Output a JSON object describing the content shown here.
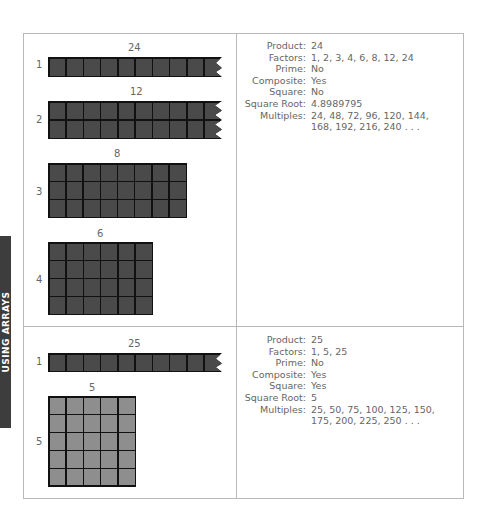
{
  "side_tab": {
    "label": "USING ARRAYS"
  },
  "sections": [
    {
      "arrays": [
        {
          "rows": 1,
          "cols_label": "24",
          "row_label": "1",
          "shade": "dark",
          "torn": true
        },
        {
          "rows": 2,
          "cols_label": "12",
          "row_label": "2",
          "shade": "dark",
          "torn": true
        },
        {
          "rows": 3,
          "cols_label": "8",
          "row_label": "3",
          "shade": "dark",
          "torn": false
        },
        {
          "rows": 4,
          "cols_label": "6",
          "row_label": "4",
          "shade": "dark",
          "torn": false
        }
      ],
      "info": {
        "product_label": "Product:",
        "product": "24",
        "factors_label": "Factors:",
        "factors": "1, 2, 3, 4, 6, 8, 12, 24",
        "prime_label": "Prime:",
        "prime": "No",
        "composite_label": "Composite:",
        "composite": "Yes",
        "square_label": "Square:",
        "square": "No",
        "sqrt_label": "Square Root:",
        "sqrt": "4.8989795",
        "multiples_label": "Multiples:",
        "multiples": "24, 48, 72, 96, 120, 144, 168, 192, 216, 240 . . ."
      }
    },
    {
      "arrays": [
        {
          "rows": 1,
          "cols_label": "25",
          "row_label": "1",
          "shade": "dark",
          "torn": true
        },
        {
          "rows": 5,
          "cols_label": "5",
          "row_label": "5",
          "shade": "light",
          "torn": false
        }
      ],
      "info": {
        "product_label": "Product:",
        "product": "25",
        "factors_label": "Factors:",
        "factors": "1, 5, 25",
        "prime_label": "Prime:",
        "prime": "No",
        "composite_label": "Composite:",
        "composite": "Yes",
        "square_label": "Square:",
        "square": "Yes",
        "sqrt_label": "Square Root:",
        "sqrt": "5",
        "multiples_label": "Multiples:",
        "multiples": "25, 50, 75, 100, 125, 150, 175, 200, 225, 250 . . ."
      }
    }
  ],
  "colors": {
    "dark_cell": "#4a4a4a",
    "light_cell": "#8e8e8e",
    "grid_line": "#111111",
    "border": "#b8b8b8",
    "side_tab": "#3d3d3d"
  }
}
